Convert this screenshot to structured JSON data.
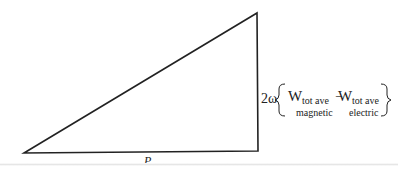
{
  "diagram": {
    "type": "power-triangle",
    "base_label": "P",
    "vertical_label": {
      "coefficient": "2ω",
      "term1_main": "W",
      "term1_sup": "tot ave",
      "term1_sub": "magnetic",
      "operator": "−",
      "term2_main": "W",
      "term2_sup": "tot ave",
      "term2_sub": "electric"
    },
    "colors": {
      "line": "#222222",
      "background": "#ffffff"
    }
  }
}
